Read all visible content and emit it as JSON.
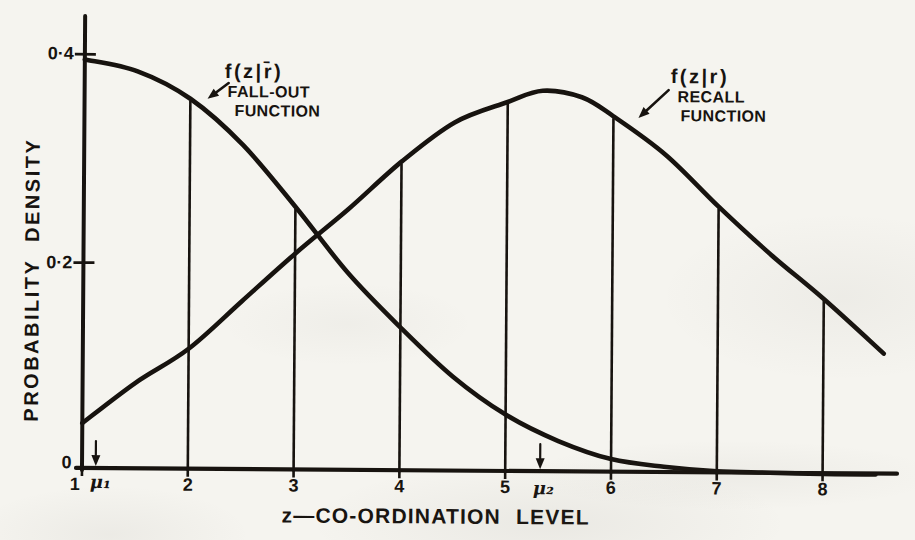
{
  "figure": {
    "ink_color": "#17130f",
    "paper_color": "#f5f4ef"
  },
  "chart_data": {
    "type": "line",
    "title": "",
    "xlabel": "z—CO-ORDINATION LEVEL",
    "ylabel": "PROBABILITY DENSITY",
    "xlim": [
      1,
      8.8
    ],
    "ylim": [
      0,
      0.43
    ],
    "grid": false,
    "legend_position": "inline-annotations",
    "x_ticks": [
      1,
      2,
      3,
      4,
      5,
      6,
      7,
      8
    ],
    "y_ticks": [
      {
        "value": 0,
        "label": "0",
        "dash": false
      },
      {
        "value": 0.2,
        "label": "0·2",
        "dash": true
      },
      {
        "value": 0.4,
        "label": "0·4",
        "dash": true
      }
    ],
    "series": [
      {
        "name": "fall-out-function",
        "label": "f(z|r̄)",
        "sublabel": [
          "FALL-OUT",
          "FUNCTION"
        ],
        "points": [
          [
            1,
            0.395
          ],
          [
            1.5,
            0.384
          ],
          [
            2,
            0.358
          ],
          [
            2.5,
            0.314
          ],
          [
            3,
            0.255
          ],
          [
            3.5,
            0.192
          ],
          [
            4,
            0.14
          ],
          [
            4.5,
            0.093
          ],
          [
            5,
            0.057
          ],
          [
            5.5,
            0.032
          ],
          [
            6,
            0.015
          ],
          [
            6.5,
            0.008
          ],
          [
            7,
            0.004
          ],
          [
            7.5,
            0.003
          ],
          [
            8,
            0.002
          ],
          [
            8.5,
            0.002
          ]
        ]
      },
      {
        "name": "recall-function",
        "label": "f(z|r)",
        "sublabel": [
          "RECALL",
          "FUNCTION"
        ],
        "points": [
          [
            1,
            0.046
          ],
          [
            1.5,
            0.085
          ],
          [
            2,
            0.118
          ],
          [
            2.5,
            0.164
          ],
          [
            3,
            0.21
          ],
          [
            3.5,
            0.253
          ],
          [
            4,
            0.299
          ],
          [
            4.5,
            0.337
          ],
          [
            5,
            0.357
          ],
          [
            5.33,
            0.368
          ],
          [
            5.7,
            0.362
          ],
          [
            6,
            0.344
          ],
          [
            6.5,
            0.307
          ],
          [
            7,
            0.258
          ],
          [
            7.5,
            0.212
          ],
          [
            8,
            0.17
          ],
          [
            8.57,
            0.118
          ]
        ]
      }
    ],
    "ordinate_lines_at": [
      2,
      3,
      4,
      5,
      6,
      7,
      8
    ],
    "curve_crossing": {
      "z": 3.25,
      "value": 0.227
    },
    "annotations": [
      {
        "name": "mu1",
        "label": "μ₁",
        "x": 1.13,
        "arrow": "down"
      },
      {
        "name": "mu2",
        "label": "μ₂",
        "x": 5.33,
        "arrow": "down"
      }
    ]
  }
}
